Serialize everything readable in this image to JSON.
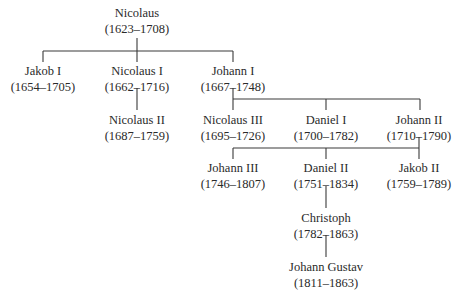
{
  "line_color": "#3a3a3a",
  "text_color": "#2a2a2a",
  "nodes": {
    "nicolaus": {
      "name": "Nicolaus",
      "years": "(1623–1708)"
    },
    "jakob_i": {
      "name": "Jakob I",
      "years": "(1654–1705)"
    },
    "nicolaus_i": {
      "name": "Nicolaus I",
      "years": "(1662–1716)"
    },
    "johann_i": {
      "name": "Johann I",
      "years": "(1667–1748)"
    },
    "nicolaus_ii": {
      "name": "Nicolaus II",
      "years": "(1687–1759)"
    },
    "nicolaus_iii": {
      "name": "Nicolaus III",
      "years": "(1695–1726)"
    },
    "daniel_i": {
      "name": "Daniel I",
      "years": "(1700–1782)"
    },
    "johann_ii": {
      "name": "Johann II",
      "years": "(1710–1790)"
    },
    "johann_iii": {
      "name": "Johann III",
      "years": "(1746–1807)"
    },
    "daniel_ii": {
      "name": "Daniel II",
      "years": "(1751–1834)"
    },
    "jakob_ii": {
      "name": "Jakob II",
      "years": "(1759–1789)"
    },
    "christoph": {
      "name": "Christoph",
      "years": "(1782–1863)"
    },
    "johann_gustav": {
      "name": "Johann Gustav",
      "years": "(1811–1863)"
    }
  },
  "edges": [
    [
      "nicolaus",
      "jakob_i"
    ],
    [
      "nicolaus",
      "nicolaus_i"
    ],
    [
      "nicolaus",
      "johann_i"
    ],
    [
      "nicolaus_i",
      "nicolaus_ii"
    ],
    [
      "johann_i",
      "nicolaus_iii"
    ],
    [
      "johann_i",
      "daniel_i"
    ],
    [
      "johann_i",
      "johann_ii"
    ],
    [
      "johann_ii",
      "johann_iii"
    ],
    [
      "johann_ii",
      "daniel_ii"
    ],
    [
      "johann_ii",
      "jakob_ii"
    ],
    [
      "daniel_ii",
      "christoph"
    ],
    [
      "christoph",
      "johann_gustav"
    ]
  ]
}
